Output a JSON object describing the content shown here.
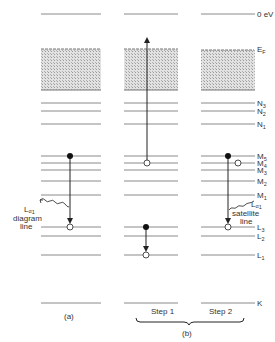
{
  "figure": {
    "columns": [
      {
        "id": "a",
        "x1": 41,
        "x2": 101,
        "caption": "(a)"
      },
      {
        "id": "b1",
        "x1": 124,
        "x2": 178,
        "caption": "Step 1"
      },
      {
        "id": "b2",
        "x1": 201,
        "x2": 255,
        "caption": "Step 2"
      }
    ],
    "group_caption": "(b)",
    "levels": [
      {
        "name": "vacuum",
        "label": "0 eV",
        "y": 14
      },
      {
        "name": "fermi",
        "label": "EF",
        "y": 49
      },
      {
        "name": "N3",
        "label": "N3",
        "y": 103
      },
      {
        "name": "N2",
        "label": "N2",
        "y": 111
      },
      {
        "name": "N1",
        "label": "N1",
        "y": 124
      },
      {
        "name": "M5",
        "label": "M5",
        "y": 156
      },
      {
        "name": "M4",
        "label": "M4",
        "y": 163
      },
      {
        "name": "M3",
        "label": "M3",
        "y": 170
      },
      {
        "name": "M2",
        "label": "M2",
        "y": 181
      },
      {
        "name": "M1",
        "label": "M1",
        "y": 195
      },
      {
        "name": "L3",
        "label": "L3",
        "y": 227
      },
      {
        "name": "L2",
        "label": "L2",
        "y": 236
      },
      {
        "name": "L1",
        "label": "L1",
        "y": 255
      },
      {
        "name": "K",
        "label": "K",
        "y": 303
      }
    ],
    "valence_band": {
      "top": 49,
      "bottom": 90
    },
    "annotations": {
      "diagram_line": {
        "line1": "Lα₁",
        "line2": "diagram",
        "line3": "line"
      },
      "satellite_line": {
        "line1": "Lα₁",
        "line2": "satellite",
        "line3": "line"
      }
    },
    "labels": {
      "vac": "0 eV",
      "ef_main": "E",
      "ef_sub": "F",
      "n3": "N",
      "n3s": "3",
      "n2": "N",
      "n2s": "2",
      "n1": "N",
      "n1s": "1",
      "m5": "M",
      "m5s": "5",
      "m4": "M",
      "m4s": "4",
      "m3": "M",
      "m3s": "3",
      "m2": "M",
      "m2s": "2",
      "m1": "M",
      "m1s": "1",
      "l3": "L",
      "l3s": "3",
      "l2": "L",
      "l2s": "2",
      "l1": "L",
      "l1s": "1",
      "k": "K"
    },
    "captions": {
      "a": "(a)",
      "step1": "Step 1",
      "step2": "Step 2",
      "b": "(b)"
    },
    "text": {
      "diag_l": "L",
      "diag_a": "α",
      "diag_1": "1",
      "diag_w1": "diagram",
      "diag_w2": "line",
      "sat_l": "L",
      "sat_a": "α",
      "sat_1": "1",
      "sat_w1": "satellite",
      "sat_w2": "line"
    }
  }
}
